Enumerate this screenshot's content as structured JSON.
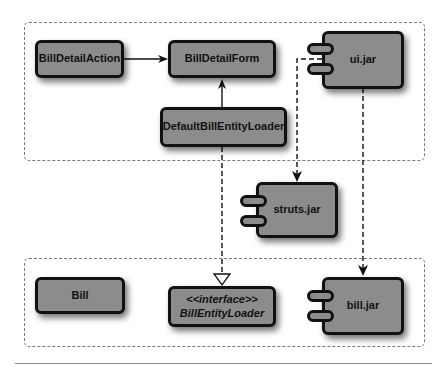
{
  "diagram": {
    "type": "uml-component-diagram",
    "packages": [
      {
        "id": "ui-package",
        "style": "dashed"
      },
      {
        "id": "bill-package",
        "style": "dashed"
      }
    ],
    "nodes": {
      "bill_detail_action": {
        "label": "BillDetailAction",
        "kind": "class"
      },
      "bill_detail_form": {
        "label": "BillDetailForm",
        "kind": "class"
      },
      "default_bill_entity_loader": {
        "label": "DefaultBillEntityLoader",
        "kind": "class"
      },
      "ui_jar": {
        "label": "ui.jar",
        "kind": "component"
      },
      "struts_jar": {
        "label": "struts.jar",
        "kind": "component"
      },
      "bill": {
        "label": "Bill",
        "kind": "class"
      },
      "bill_entity_loader": {
        "stereotype": "<<interface>>",
        "label": "BillEntityLoader",
        "kind": "interface"
      },
      "bill_jar": {
        "label": "bill.jar",
        "kind": "component"
      }
    },
    "edges": [
      {
        "from": "BillDetailAction",
        "to": "BillDetailForm",
        "style": "solid",
        "arrow": "open"
      },
      {
        "from": "DefaultBillEntityLoader",
        "to": "BillDetailForm",
        "style": "solid",
        "arrow": "open"
      },
      {
        "from": "DefaultBillEntityLoader",
        "to": "BillEntityLoader",
        "style": "dashed",
        "arrow": "hollow-triangle"
      },
      {
        "from": "ui.jar",
        "to": "struts.jar",
        "style": "dashed",
        "arrow": "open"
      },
      {
        "from": "ui.jar",
        "to": "bill.jar",
        "style": "dashed",
        "arrow": "open"
      }
    ],
    "colors": {
      "node_fill": "#8c8c8c",
      "node_border": "#111111",
      "package_border": "#7a7a7a",
      "background": "#ffffff"
    }
  }
}
